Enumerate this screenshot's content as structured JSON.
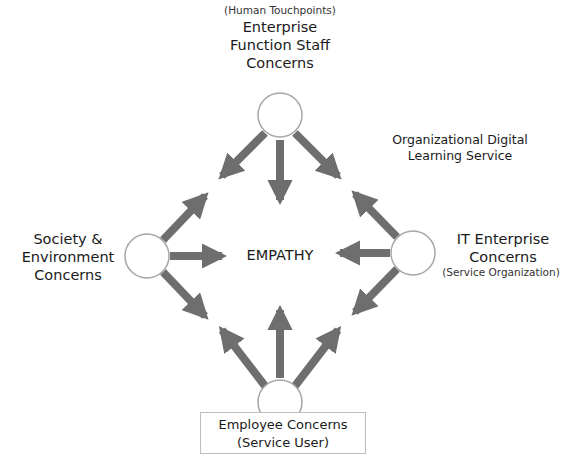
{
  "diagram": {
    "center": {
      "label": "EMPATHY"
    },
    "nodes": {
      "top": {
        "subtitle": "(Human Touchpoints)",
        "title_lines": [
          "Enterprise",
          "Function Staff",
          "Concerns"
        ]
      },
      "right": {
        "title_lines": [
          "IT Enterprise",
          "Concerns"
        ],
        "subtitle": "(Service Organization)"
      },
      "left": {
        "title_lines": [
          "Society &",
          "Environment",
          "Concerns"
        ]
      },
      "bottom": {
        "title_lines": [
          "Employee Concerns",
          "(Service User)"
        ]
      }
    },
    "annotation": {
      "lines": [
        "Organizational Digital",
        "Learning Service"
      ]
    },
    "colors": {
      "arrow": "#6e6e6e",
      "circle_stroke": "#a6a6a6",
      "circle_fill": "#ffffff",
      "box_border": "#bdbdbd",
      "text": "#1a1a1a"
    },
    "edges": [
      {
        "from": "top",
        "to": "center"
      },
      {
        "from": "top",
        "to": "left-upper-gap"
      },
      {
        "from": "top",
        "to": "right-upper-gap"
      },
      {
        "from": "left",
        "to": "center"
      },
      {
        "from": "left",
        "to": "top-left-gap"
      },
      {
        "from": "left",
        "to": "bottom-left-gap"
      },
      {
        "from": "right",
        "to": "center"
      },
      {
        "from": "right",
        "to": "top-right-gap"
      },
      {
        "from": "right",
        "to": "bottom-right-gap"
      },
      {
        "from": "bottom",
        "to": "center"
      },
      {
        "from": "bottom",
        "to": "left-lower-gap"
      },
      {
        "from": "bottom",
        "to": "right-lower-gap"
      }
    ]
  }
}
